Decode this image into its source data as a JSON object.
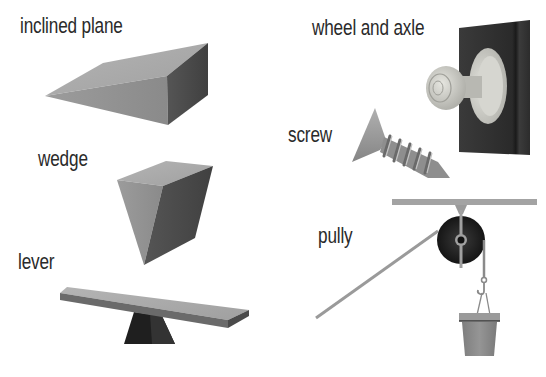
{
  "machines": [
    {
      "id": "inclined-plane",
      "label": "inclined plane"
    },
    {
      "id": "wedge",
      "label": "wedge"
    },
    {
      "id": "lever",
      "label": "lever"
    },
    {
      "id": "wheel-and-axle",
      "label": "wheel and axle"
    },
    {
      "id": "screw",
      "label": "screw"
    },
    {
      "id": "pulley",
      "label": "pully"
    }
  ],
  "colors": {
    "background": "#ffffff",
    "label_text": "#2a2a2a",
    "surface_light": "#a8a8a8",
    "surface_mid": "#8a8a8a",
    "surface_dark": "#4a4a4a",
    "door": "#2e2e2e",
    "knob": "#cfcfc9",
    "pulley_wheel": "#222222",
    "rope": "#9a9a9a",
    "bucket": "#8c8c8c"
  }
}
